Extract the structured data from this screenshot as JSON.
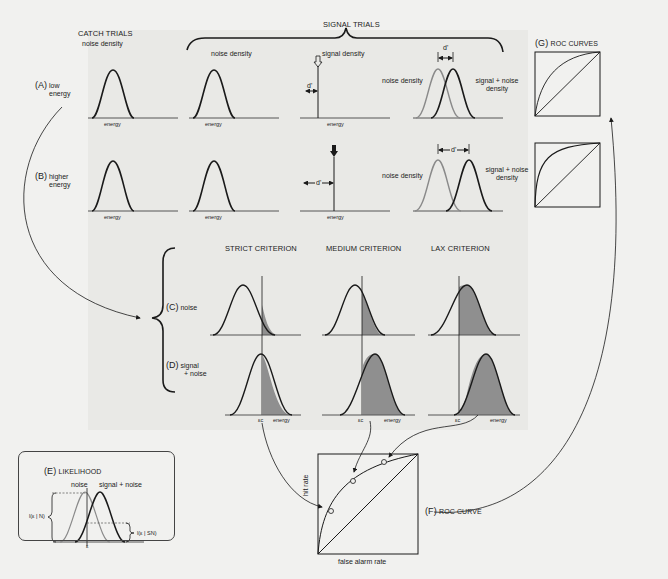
{
  "headers": {
    "signal_trials": "SIGNAL TRIALS",
    "catch_trials": "CATCH TRIALS",
    "catch_sub": "noise density",
    "roc_curves_tag": "(G)",
    "roc_curves": "ROC CURVES",
    "strict": "STRICT CRITERION",
    "medium": "MEDIUM CRITERION",
    "lax": "LAX CRITERION"
  },
  "rows": {
    "a_tag": "(A)",
    "a_line1": "low",
    "a_line2": "energy",
    "b_tag": "(B)",
    "b_line1": "higher",
    "b_line2": "energy",
    "c_tag": "(C)",
    "c_label": "noise",
    "d_tag": "(D)",
    "d_line1": "signal",
    "d_line2": "+ noise"
  },
  "panels": {
    "noise_density": "noise density",
    "signal_density": "signal density",
    "signal_noise_line1": "signal + noise",
    "signal_noise_line2": "density",
    "energy": "energy",
    "dprime": "d'",
    "criterion": "εc"
  },
  "likelihood": {
    "tag": "(E)",
    "title": "LIKELIHOOD",
    "noise": "noise",
    "signal_noise": "signal + noise",
    "l_n": "l(ε | N)",
    "l_sn": "l(ε | SN)",
    "epsilon": "ε"
  },
  "roc": {
    "tag": "(F)",
    "title": "ROC CURVE",
    "ylabel": "hit rate",
    "xlabel": "false alarm rate",
    "points": [
      {
        "name": "strict",
        "far": 0.12,
        "hit": 0.43
      },
      {
        "name": "medium",
        "far": 0.35,
        "hit": 0.73
      },
      {
        "name": "lax",
        "far": 0.65,
        "hit": 0.92
      }
    ]
  },
  "colors": {
    "line": "#1a1a1a",
    "noise_curve": "#8a8a8a",
    "shade": "#8f8f8f",
    "background": "#f1f1ef"
  }
}
